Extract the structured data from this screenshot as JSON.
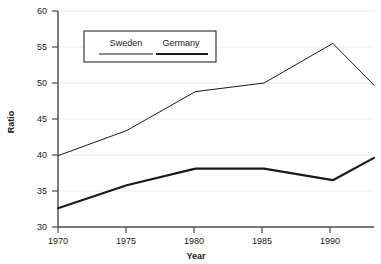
{
  "chart_data": {
    "type": "line",
    "title": "",
    "xlabel": "Year",
    "ylabel": "Ratio",
    "xlim": [
      1970,
      1993
    ],
    "ylim": [
      30,
      60
    ],
    "xticks": [
      1970,
      1975,
      1980,
      1985,
      1990
    ],
    "yticks": [
      30,
      35,
      40,
      45,
      50,
      55,
      60
    ],
    "grid": true,
    "grid_axis": "y",
    "legend_position": "top-center",
    "x": [
      1970,
      1975,
      1980,
      1985,
      1990,
      1993
    ],
    "series": [
      {
        "name": "Sweden",
        "values": [
          39.9,
          43.4,
          48.8,
          50.0,
          55.5,
          49.7
        ],
        "color": "#1a1a1a",
        "line_width": 1
      },
      {
        "name": "Germany",
        "values": [
          32.6,
          35.8,
          38.1,
          38.1,
          36.5,
          39.6
        ],
        "color": "#1a1a1a",
        "line_width": 2.2
      }
    ]
  },
  "axes": {
    "y_title": "Ratio",
    "x_title": "Year",
    "y_tick_labels": [
      "60",
      "55",
      "50",
      "45",
      "40",
      "35",
      "30"
    ],
    "x_tick_labels": [
      "1970",
      "1975",
      "1980",
      "1985",
      "1990"
    ]
  },
  "legend": {
    "items": [
      {
        "label": "Sweden",
        "swatch": "thin-line-swatch"
      },
      {
        "label": "Germany",
        "swatch": "thick-line-swatch"
      }
    ]
  },
  "colors": {
    "line": "#1a1a1a",
    "grid": "#e8e8e8",
    "axis": "#4a4a4a",
    "background": "#ffffff"
  }
}
